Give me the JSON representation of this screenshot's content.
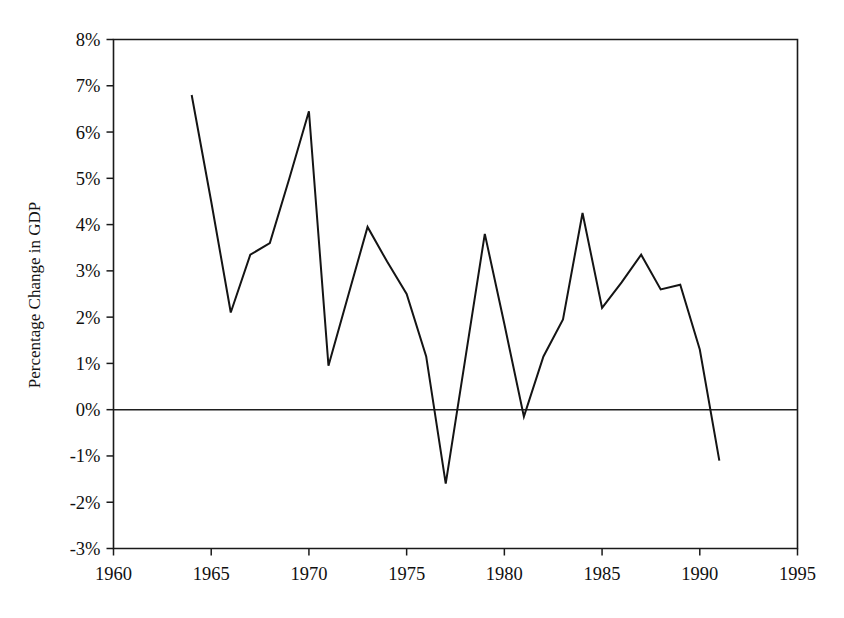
{
  "chart_data": {
    "type": "line",
    "title": "",
    "subtitle": "",
    "xlabel": "",
    "ylabel": "Percentage Change in GDP",
    "xlim": [
      1960,
      1995
    ],
    "ylim": [
      -3,
      8
    ],
    "xticks": [
      1960,
      1965,
      1970,
      1975,
      1980,
      1985,
      1990,
      1995
    ],
    "xtick_labels": [
      "1960",
      "1965",
      "1970",
      "1975",
      "1980",
      "1985",
      "1990",
      "1995"
    ],
    "yticks": [
      -3,
      -2,
      -1,
      0,
      1,
      2,
      3,
      4,
      5,
      6,
      7,
      8
    ],
    "ytick_labels": [
      "-3%",
      "-2%",
      "-1%",
      "0%",
      "1%",
      "2%",
      "3%",
      "4%",
      "5%",
      "6%",
      "7%",
      "8%"
    ],
    "grid": false,
    "legend": false,
    "legend_position": "none",
    "zero_reference_line": true,
    "line_color": "#141414",
    "x": [
      1964,
      1965,
      1966,
      1967,
      1968,
      1969,
      1970,
      1971,
      1972,
      1973,
      1974,
      1975,
      1976,
      1977,
      1978,
      1979,
      1980,
      1981,
      1982,
      1983,
      1984,
      1985,
      1986,
      1987,
      1988,
      1989,
      1990,
      1991
    ],
    "values": [
      6.8,
      4.5,
      2.1,
      3.35,
      3.6,
      5.0,
      6.45,
      0.95,
      2.45,
      3.95,
      3.2,
      2.5,
      1.15,
      -1.6,
      1.1,
      3.8,
      1.85,
      -0.15,
      1.15,
      1.95,
      4.25,
      2.2,
      2.75,
      3.35,
      2.6,
      2.7,
      1.3,
      -1.1
    ],
    "series": [
      {
        "name": "Percentage Change in GDP",
        "x": [
          1964,
          1965,
          1966,
          1967,
          1968,
          1969,
          1970,
          1971,
          1972,
          1973,
          1974,
          1975,
          1976,
          1977,
          1978,
          1979,
          1980,
          1981,
          1982,
          1983,
          1984,
          1985,
          1986,
          1987,
          1988,
          1989,
          1990,
          1991
        ],
        "values": [
          6.8,
          4.5,
          2.1,
          3.35,
          3.6,
          5.0,
          6.45,
          0.95,
          2.45,
          3.95,
          3.2,
          2.5,
          1.15,
          -1.6,
          1.1,
          3.8,
          1.85,
          -0.15,
          1.15,
          1.95,
          4.25,
          2.2,
          2.75,
          3.35,
          2.6,
          2.7,
          1.3,
          -1.1
        ]
      }
    ]
  }
}
